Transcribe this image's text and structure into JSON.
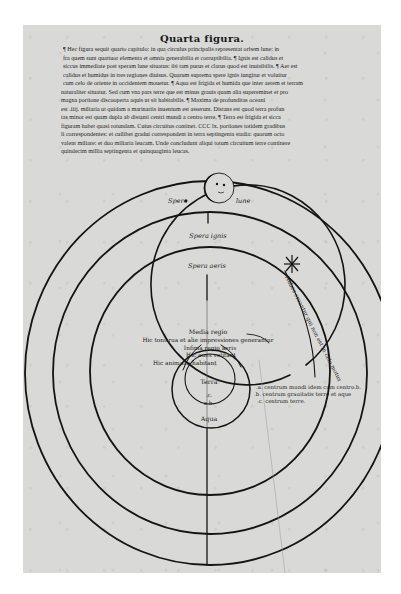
{
  "page": {
    "title": "Quarta figura.",
    "text_lines": [
      "¶ Hec figura sequit quarto capitulo: in qua circulus principalis representat orbem lune: in",
      "fra quem sunt quattuor elementa et omnia generabilia et corruptibilia. ¶ Ignis est calidus et",
      "siccus immediate post speram lune situatus: ibi tam purus et clarus quod est inuisibilis. ¶ Aer est",
      "calidus et humidus in tres regiones diuisus. Quarum suprema spere ignis iungitur et voluitur",
      "cum celo de oriente in occidentem mouetur. ¶ Aqua est frigida et humida que inter aerem et terram",
      "naturaliter situatur. Sed cum vna pars terre que est minus grauis quam alia supereminet et pro",
      "magna portione discooperta aquis ut sit habitabilis. ¶ Maxima de profunditas oceani",
      "est .iiij. miliaria ut quidam a marinariis inuentum est asserunt. Distans est quod terra profun",
      "tas minor est quam dupla ab distanti centri mundi a centro terre. ¶ Terra est frigida et sicca",
      "figuram habet quasi rotundam. Cuius circuitus continet. CCC lx. portiones totidem gradibus",
      "li correspondentes: et cuilibet gradui correspondent in terra septingenta stadia: quorum octo",
      "valent miliare: et duo miliaria leucam. Unde concludunt aliqui totum circuitum terre continere",
      "quindecim millia septingenta et quinquaginta leucas."
    ]
  },
  "diagram": {
    "labels": {
      "sphere_moon_left": "Spere",
      "sphere_moon_right": "lune",
      "sphere_fire": "Spera ignis",
      "sphere_air": "Spera aeris",
      "middle_region": "Media regio",
      "thunder": "Hic tonitrua et alie impressiones generantur",
      "lower_region": "Infima regio aeris",
      "birds": "Hic aues volitant",
      "animals": "Hic animalia habitant",
      "earth": "Terra",
      "point_c": ".c.",
      "point_ab": "a.b.",
      "water": "Aqua",
      "upper_air": "Nubes creantur qui non est in celo motus",
      "legend_a": ".a. centrum mundi idem cum centro.b.",
      "legend_b": ".b. centrum grauitatis terre et aque",
      "legend_c": ".c. centrum terre."
    },
    "ink_color": "#141414",
    "paper_color": "#d9d9d7"
  }
}
